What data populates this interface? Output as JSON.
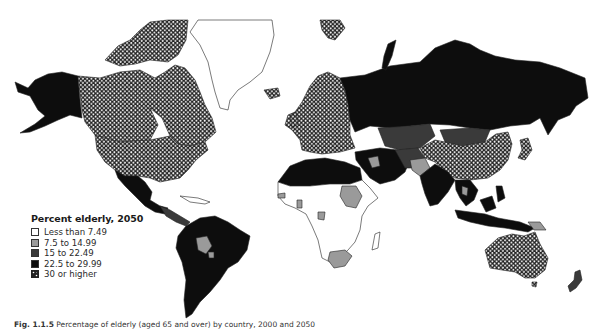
{
  "legend": {
    "title": "Percent elderly, 2050",
    "items": [
      {
        "label": "Less than 7.49",
        "fill": "#ffffff",
        "pattern": "none"
      },
      {
        "label": "7.5 to 14.99",
        "fill": "#9a9a9a",
        "pattern": "none"
      },
      {
        "label": "15 to 22.49",
        "fill": "#3a3a3a",
        "pattern": "none"
      },
      {
        "label": "22.5 to 29.99",
        "fill": "#0d0d0d",
        "pattern": "none"
      },
      {
        "label": "30 or higher",
        "fill": "#2a2a2a",
        "pattern": "dots"
      }
    ]
  },
  "caption": {
    "label": "Fig. 1.1.5",
    "text": "Percentage of elderly (aged 65 and over) by country, 2000 and 2050"
  },
  "map": {
    "title": "World map of percent elderly in 2050",
    "regions": [
      {
        "name": "Canada",
        "class": "30 or higher"
      },
      {
        "name": "United States",
        "class": "30 or higher"
      },
      {
        "name": "Alaska",
        "class": "22.5 to 29.99"
      },
      {
        "name": "Greenland",
        "class": "Less than 7.49"
      },
      {
        "name": "Mexico",
        "class": "22.5 to 29.99"
      },
      {
        "name": "Central America",
        "class": "15 to 22.49"
      },
      {
        "name": "South America",
        "class": "22.5 to 29.99"
      },
      {
        "name": "Bolivia",
        "class": "7.5 to 14.99"
      },
      {
        "name": "Europe",
        "class": "30 or higher"
      },
      {
        "name": "Russia",
        "class": "22.5 to 29.99"
      },
      {
        "name": "Central Asia",
        "class": "15 to 22.49"
      },
      {
        "name": "China",
        "class": "30 or higher"
      },
      {
        "name": "Mongolia",
        "class": "15 to 22.49"
      },
      {
        "name": "Japan",
        "class": "30 or higher"
      },
      {
        "name": "India",
        "class": "22.5 to 29.99"
      },
      {
        "name": "Pakistan",
        "class": "7.5 to 14.99"
      },
      {
        "name": "Middle East",
        "class": "22.5 to 29.99"
      },
      {
        "name": "North Africa",
        "class": "22.5 to 29.99"
      },
      {
        "name": "Sudan",
        "class": "7.5 to 14.99"
      },
      {
        "name": "Sub-Saharan Africa",
        "class": "Less than 7.49"
      },
      {
        "name": "South Africa",
        "class": "7.5 to 14.99"
      },
      {
        "name": "Southeast Asia",
        "class": "22.5 to 29.99"
      },
      {
        "name": "Australia",
        "class": "30 or higher"
      },
      {
        "name": "New Zealand",
        "class": "22.5 to 29.99"
      }
    ]
  }
}
